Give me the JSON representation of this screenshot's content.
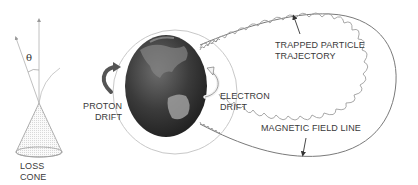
{
  "diagram": {
    "labels": {
      "theta": "θ",
      "loss_cone_line1": "LOSS",
      "loss_cone_line2": "CONE",
      "proton_drift_line1": "PROTON",
      "proton_drift_line2": "DRIFT",
      "electron_drift_line1": "ELECTRON",
      "electron_drift_line2": "DRIFT",
      "trapped_line1": "TRAPPED PARTICLE",
      "trapped_line2": "TRAJECTORY",
      "field_line": "MAGNETIC FIELD LINE"
    },
    "colors": {
      "line": "#6a6a6a",
      "light_line": "#bdbdbd",
      "earth_dark": "#2e2e2e",
      "earth_light": "#9a9a9a",
      "text": "#3a3a3a"
    }
  }
}
